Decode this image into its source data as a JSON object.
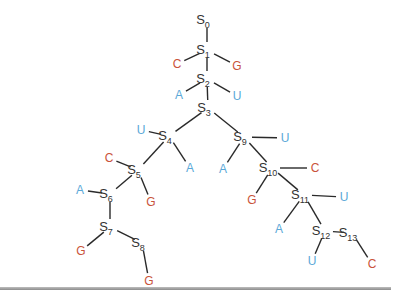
{
  "diagram": {
    "title": "",
    "colors": {
      "state": "#333333",
      "edge": "#2a2a2a",
      "purine": "#c9533a",
      "pyrimidine": "#5aa8d8",
      "rule": "#9a9a9a"
    },
    "states": [
      {
        "id": "S0",
        "letter": "S",
        "sub": "0",
        "x": 207,
        "y": 20
      },
      {
        "id": "S1",
        "letter": "S",
        "sub": "1",
        "x": 207,
        "y": 50
      },
      {
        "id": "S2",
        "letter": "S",
        "sub": "2",
        "x": 207,
        "y": 79
      },
      {
        "id": "S3",
        "letter": "S",
        "sub": "3",
        "x": 208,
        "y": 108
      },
      {
        "id": "S4",
        "letter": "S",
        "sub": "4",
        "x": 169,
        "y": 136
      },
      {
        "id": "S5",
        "letter": "S",
        "sub": "5",
        "x": 138,
        "y": 170
      },
      {
        "id": "S6",
        "letter": "S",
        "sub": "6",
        "x": 110,
        "y": 194
      },
      {
        "id": "S7",
        "letter": "S",
        "sub": "7",
        "x": 110,
        "y": 227
      },
      {
        "id": "S8",
        "letter": "S",
        "sub": "8",
        "x": 142,
        "y": 243
      },
      {
        "id": "S9",
        "letter": "S",
        "sub": "9",
        "x": 244,
        "y": 137
      },
      {
        "id": "S10",
        "letter": "S",
        "sub": "10",
        "x": 272,
        "y": 168
      },
      {
        "id": "S11",
        "letter": "S",
        "sub": "11",
        "x": 304,
        "y": 195
      },
      {
        "id": "S12",
        "letter": "S",
        "sub": "12",
        "x": 325,
        "y": 231
      },
      {
        "id": "S13",
        "letter": "S",
        "sub": "13",
        "x": 352,
        "y": 233
      }
    ],
    "bases": [
      {
        "label": "C",
        "type": "purine",
        "x": 177,
        "y": 64,
        "parent": "S1"
      },
      {
        "label": "G",
        "type": "purine",
        "x": 237,
        "y": 66,
        "parent": "S1"
      },
      {
        "label": "A",
        "type": "pyrimidine",
        "x": 179,
        "y": 95,
        "parent": "S2"
      },
      {
        "label": "U",
        "type": "pyrimidine",
        "x": 237,
        "y": 96,
        "parent": "S2"
      },
      {
        "label": "U",
        "type": "pyrimidine",
        "x": 141,
        "y": 130,
        "parent": "S4"
      },
      {
        "label": "A",
        "type": "pyrimidine",
        "x": 190,
        "y": 168,
        "parent": "S4"
      },
      {
        "label": "U",
        "type": "pyrimidine",
        "x": 285,
        "y": 138,
        "parent": "S9"
      },
      {
        "label": "A",
        "type": "pyrimidine",
        "x": 223,
        "y": 169,
        "parent": "S9"
      },
      {
        "label": "C",
        "type": "purine",
        "x": 109,
        "y": 158,
        "parent": "S5"
      },
      {
        "label": "G",
        "type": "purine",
        "x": 151,
        "y": 202,
        "parent": "S5"
      },
      {
        "label": "A",
        "type": "pyrimidine",
        "x": 80,
        "y": 190,
        "parent": "S6"
      },
      {
        "label": "G",
        "type": "purine",
        "x": 81,
        "y": 251,
        "parent": "S7"
      },
      {
        "label": "G",
        "type": "purine",
        "x": 149,
        "y": 281,
        "parent": "S8"
      },
      {
        "label": "C",
        "type": "purine",
        "x": 315,
        "y": 168,
        "parent": "S10"
      },
      {
        "label": "G",
        "type": "purine",
        "x": 252,
        "y": 200,
        "parent": "S10"
      },
      {
        "label": "U",
        "type": "pyrimidine",
        "x": 344,
        "y": 197,
        "parent": "S11"
      },
      {
        "label": "A",
        "type": "pyrimidine",
        "x": 279,
        "y": 229,
        "parent": "S11"
      },
      {
        "label": "U",
        "type": "pyrimidine",
        "x": 312,
        "y": 261,
        "parent": "S12"
      },
      {
        "label": "C",
        "type": "purine",
        "x": 372,
        "y": 264,
        "parent": "S13"
      }
    ],
    "edges": [
      [
        "S0",
        "S1"
      ],
      [
        "S1",
        "S2"
      ],
      [
        "S2",
        "S3"
      ],
      [
        "S3",
        "S4"
      ],
      [
        "S3",
        "S9"
      ],
      [
        "S4",
        "S5"
      ],
      [
        "S5",
        "S6"
      ],
      [
        "S6",
        "S7"
      ],
      [
        "S7",
        "S8"
      ],
      [
        "S9",
        "S10"
      ],
      [
        "S10",
        "S11"
      ],
      [
        "S11",
        "S12"
      ],
      [
        "S12",
        "S13"
      ]
    ]
  }
}
